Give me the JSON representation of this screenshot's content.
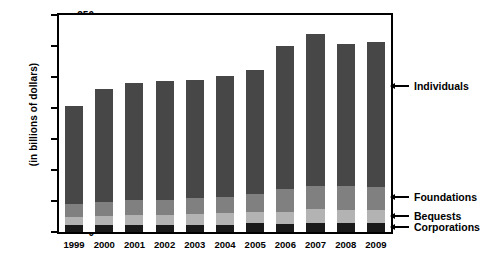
{
  "chart_data": {
    "type": "bar",
    "stacked": true,
    "title": "",
    "subtitle": "",
    "xlabel": "",
    "ylabel": "(in billions of dollars)",
    "ylim": [
      0,
      350
    ],
    "yticks": [
      0,
      50,
      100,
      150,
      200,
      250,
      300,
      350
    ],
    "grid": false,
    "legend_position": "right-callouts",
    "categories": [
      "1999",
      "2000",
      "2001",
      "2002",
      "2003",
      "2004",
      "2005",
      "2006",
      "2007",
      "2008",
      "2009"
    ],
    "series": [
      {
        "name": "Corporations",
        "color": "#1a1a1a",
        "values": [
          11,
          11,
          11,
          11,
          12,
          12,
          14,
          13,
          15,
          14,
          14
        ]
      },
      {
        "name": "Bequests",
        "color": "#b3b3b3",
        "values": [
          14,
          15,
          16,
          16,
          17,
          18,
          19,
          20,
          22,
          21,
          21
        ]
      },
      {
        "name": "Foundations",
        "color": "#808080",
        "values": [
          20,
          23,
          24,
          25,
          26,
          27,
          28,
          36,
          37,
          39,
          38
        ]
      },
      {
        "name": "Individuals",
        "color": "#474747",
        "values": [
          158,
          182,
          190,
          191,
          190,
          195,
          201,
          231,
          245,
          230,
          234
        ]
      }
    ],
    "totals": [
      203,
      231,
      241,
      243,
      245,
      252,
      262,
      300,
      319,
      304,
      307
    ]
  },
  "axis": {
    "y_title": "(in billions of dollars)",
    "y_tick_labels": [
      "0",
      "50",
      "100",
      "150",
      "200",
      "250",
      "300",
      "350"
    ],
    "x_tick_labels": [
      "1999",
      "2000",
      "2001",
      "2002",
      "2003",
      "2004",
      "2005",
      "2006",
      "2007",
      "2008",
      "2009"
    ]
  },
  "callouts": [
    {
      "label": "Individuals",
      "value_at": 235
    },
    {
      "label": "Foundations",
      "value_at": 57
    },
    {
      "label": "Bequests",
      "value_at": 26
    },
    {
      "label": "Corporations",
      "value_at": 8
    }
  ]
}
